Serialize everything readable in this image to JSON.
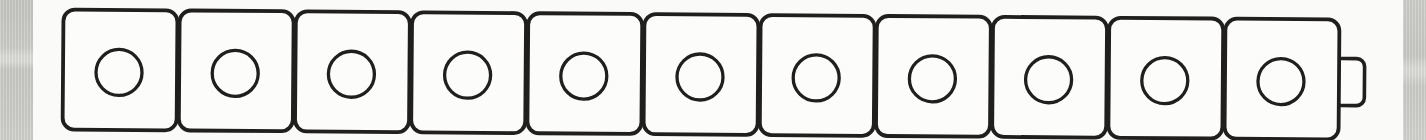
{
  "figure": {
    "cube_count": 11,
    "stud_shape": "circle",
    "studs_per_cube": 1,
    "connector_tab": {
      "present": true,
      "side": "right"
    },
    "colors": {
      "ink_outline": "#211f1e",
      "cube_fill": "#fcfcfa",
      "paper_white": "#fafaf8",
      "paper_edge_gray": "#c8c8c4"
    }
  }
}
